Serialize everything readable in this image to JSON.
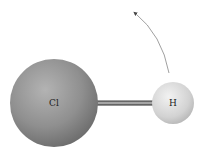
{
  "diagram": {
    "type": "molecule",
    "atoms": [
      {
        "symbol": "Cl",
        "cx": 54,
        "cy": 103,
        "r": 44,
        "color": "#8e8e8e"
      },
      {
        "symbol": "H",
        "cx": 173,
        "cy": 103,
        "r": 21,
        "color": "#d6d6d6"
      }
    ],
    "bond": {
      "from": "Cl",
      "to": "H"
    },
    "arrow": {
      "direction": "counterclockwise rotation",
      "color": "#777777"
    }
  }
}
